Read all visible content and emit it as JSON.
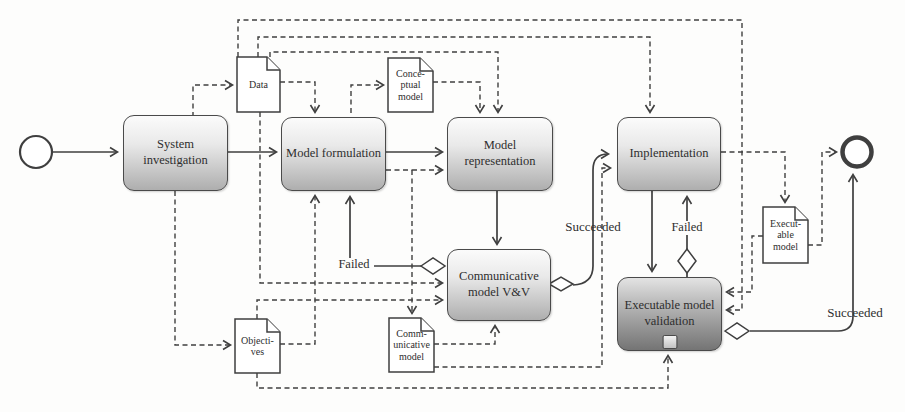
{
  "figure_type": "bpmn-style modeling lifecycle flow diagram",
  "colors": {
    "background": "#fdfdfc",
    "line": "#3f3f3f",
    "task_fill_top": "#fbfbfb",
    "task_fill_bottom": "#aeaeae",
    "dark_task_fill_bottom": "#747474"
  },
  "icons": {
    "start_event": "thin-circle",
    "end_event": "thick-circle",
    "gateway": "diamond",
    "document": "page-with-folded-corner",
    "subprocess_marker": "small-square"
  },
  "tasks": [
    {
      "id": "system-investigation",
      "label": "System investigation"
    },
    {
      "id": "model-formulation",
      "label": "Model formulation"
    },
    {
      "id": "model-representation",
      "label": "Model representation"
    },
    {
      "id": "implementation",
      "label": "Implementation"
    },
    {
      "id": "communicative-model-vv",
      "label": "Communicative model V&V"
    },
    {
      "id": "executable-model-validation",
      "label": "Executable model validation"
    }
  ],
  "documents": [
    {
      "id": "data",
      "lines": [
        "Data",
        "",
        ""
      ]
    },
    {
      "id": "conceptual-model",
      "lines": [
        "Conce-",
        "ptual",
        "model"
      ]
    },
    {
      "id": "objectives",
      "lines": [
        "Objecti-",
        "ves",
        ""
      ]
    },
    {
      "id": "communicative-model",
      "lines": [
        "Comm-",
        "unicative",
        "model"
      ]
    },
    {
      "id": "executable-model",
      "lines": [
        "Execut-",
        "able",
        "model"
      ]
    }
  ],
  "edge_labels": {
    "failed_left": "Failed",
    "failed_right": "Failed",
    "succeeded_left": "Succeeded",
    "succeeded_right": "Succeeded"
  }
}
